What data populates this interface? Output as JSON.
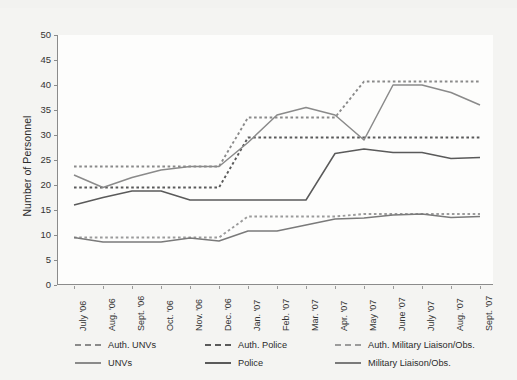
{
  "chart_data": {
    "type": "line",
    "title": "",
    "xlabel": "",
    "ylabel": "Number of Personnel",
    "ylim": [
      0,
      50
    ],
    "ytick_values": [
      0,
      5,
      10,
      15,
      20,
      25,
      30,
      35,
      40,
      45,
      50
    ],
    "grid": false,
    "legend_position": "bottom",
    "categories": [
      "July '06",
      "Aug. '06",
      "Sept. '06",
      "Oct. '06",
      "Nov. '06",
      "Dec. '06",
      "Jan. '07",
      "Feb. '07",
      "Mar. '07",
      "Apr. '07",
      "May '07",
      "June '07",
      "July '07",
      "Aug. '07",
      "Sept. '07"
    ],
    "series": [
      {
        "name": "Auth. UNVs",
        "style": "dashed",
        "color": "#8a8a8a",
        "values": [
          23.7,
          23.7,
          23.7,
          23.7,
          23.7,
          23.7,
          33.5,
          33.5,
          33.5,
          33.5,
          40.7,
          40.7,
          40.7,
          40.7,
          40.7
        ]
      },
      {
        "name": "Auth. Police",
        "style": "dashed",
        "color": "#5a5a5a",
        "values": [
          19.5,
          19.5,
          19.5,
          19.5,
          19.5,
          19.5,
          29.5,
          29.5,
          29.5,
          29.5,
          29.5,
          29.5,
          29.5,
          29.5,
          29.5
        ]
      },
      {
        "name": "Auth. Military Liaison/Obs.",
        "style": "dashed",
        "color": "#9b9b9b",
        "values": [
          9.5,
          9.5,
          9.5,
          9.5,
          9.5,
          9.5,
          13.7,
          13.7,
          13.7,
          13.7,
          14.2,
          14.2,
          14.2,
          14.2,
          14.2
        ]
      },
      {
        "name": "UNVs",
        "style": "solid",
        "color": "#8a8a8a",
        "values": [
          22.0,
          19.5,
          21.5,
          23.0,
          23.7,
          23.7,
          28.5,
          34.0,
          35.5,
          34.0,
          29.0,
          40.0,
          40.0,
          38.5,
          36.0
        ]
      },
      {
        "name": "Police",
        "style": "solid",
        "color": "#5a5a5a",
        "values": [
          16.0,
          17.5,
          18.8,
          18.8,
          17.0,
          17.0,
          17.0,
          17.0,
          17.0,
          26.3,
          27.2,
          26.5,
          26.5,
          25.3,
          25.5
        ]
      },
      {
        "name": "Military Liaison/Obs.",
        "style": "solid",
        "color": "#7a7a7a",
        "values": [
          9.5,
          8.6,
          8.6,
          8.6,
          9.4,
          8.8,
          10.8,
          10.8,
          12.0,
          13.2,
          13.4,
          14.0,
          14.2,
          13.5,
          13.7
        ]
      }
    ]
  },
  "legend": {
    "items": [
      {
        "label": "Auth. UNVs",
        "style": "dashed"
      },
      {
        "label": "Auth. Police",
        "style": "dashed"
      },
      {
        "label": "Auth. Military Liaison/Obs.",
        "style": "dashed"
      },
      {
        "label": "UNVs",
        "style": "solid"
      },
      {
        "label": "Police",
        "style": "solid"
      },
      {
        "label": "Military Liaison/Obs.",
        "style": "solid"
      }
    ]
  }
}
